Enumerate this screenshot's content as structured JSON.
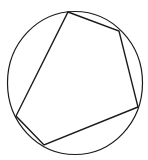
{
  "diagram": {
    "stroke_color": "#1a1a1a",
    "background": "#ffffff",
    "circle": {
      "cx": 75,
      "cy": 83,
      "rx": 67.5,
      "ry": 71.5
    },
    "pentagon": {
      "vertices": [
        {
          "x": 68,
          "y": 12
        },
        {
          "x": 119,
          "y": 31
        },
        {
          "x": 138,
          "y": 107
        },
        {
          "x": 44,
          "y": 145
        },
        {
          "x": 16,
          "y": 116
        }
      ]
    }
  }
}
